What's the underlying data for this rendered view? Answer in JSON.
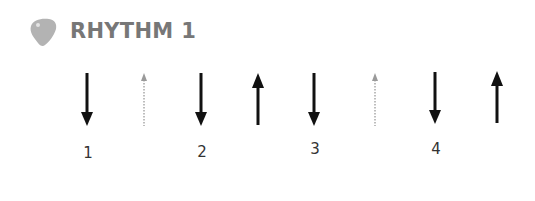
{
  "header": {
    "icon": "guitar-pick-icon",
    "title": "RHYTHM 1",
    "icon_color": "#b3b3b3"
  },
  "pattern": {
    "strums": [
      {
        "direction": "down",
        "style": "solid",
        "x": 87
      },
      {
        "direction": "up",
        "style": "dotted",
        "x": 144
      },
      {
        "direction": "down",
        "style": "solid",
        "x": 201
      },
      {
        "direction": "up",
        "style": "solid",
        "x": 258
      },
      {
        "direction": "down",
        "style": "solid",
        "x": 314
      },
      {
        "direction": "up",
        "style": "dotted",
        "x": 375
      },
      {
        "direction": "down",
        "style": "solid",
        "x": 435
      },
      {
        "direction": "up",
        "style": "solid",
        "x": 497
      }
    ],
    "beats": [
      "1",
      "2",
      "3",
      "4"
    ],
    "colors": {
      "solid": "#111111",
      "dotted": "#9a9a9a",
      "beat_label": "#333333"
    }
  }
}
